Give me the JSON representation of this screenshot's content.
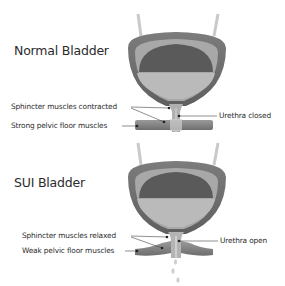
{
  "panels": [
    {
      "title": "Normal Bladder",
      "labels": {
        "sphincter": "Sphincter muscles contracted",
        "pelvic": "Strong pelvic floor muscles",
        "urethra": "Urethra closed"
      }
    },
    {
      "title": "SUI Bladder",
      "labels": {
        "sphincter": "Sphincter muscles relaxed",
        "pelvic": "Weak pelvic floor muscles",
        "urethra": "Urethra open"
      }
    }
  ],
  "colors": {
    "wall_outer": "#6f6f6f",
    "wall_inner_band": "#a9a9a9",
    "air_space": "#5c5c5c",
    "urine": "#b9b9b9",
    "muscle": "#8a8a8a",
    "text": "#2b2b2b"
  }
}
